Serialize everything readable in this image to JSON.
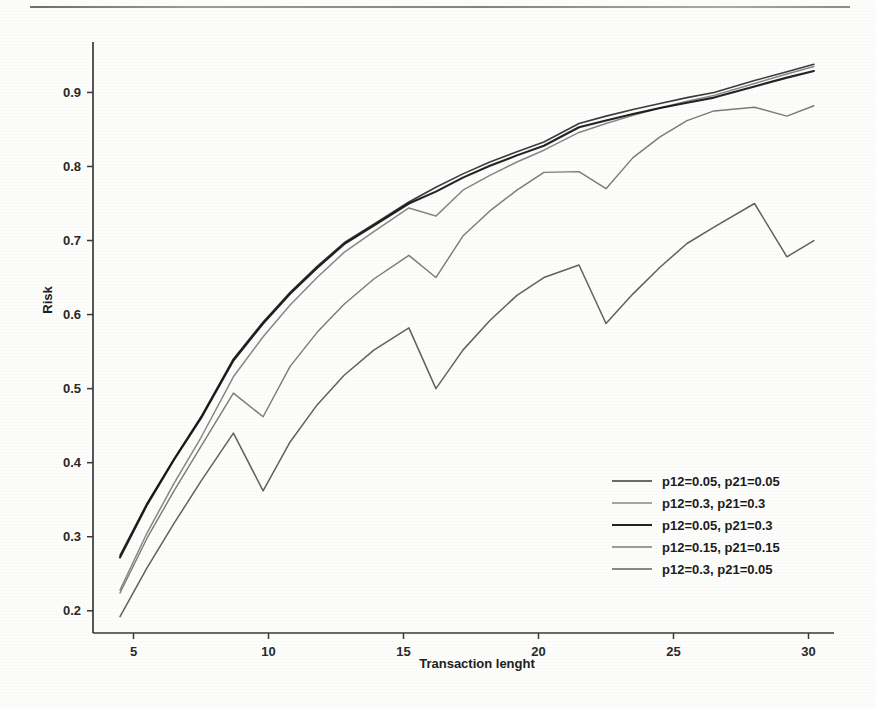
{
  "chart_data": {
    "type": "line",
    "title": "",
    "xlabel": "Transaction lenght",
    "ylabel": "Risk",
    "xlim": [
      3.5,
      30.5
    ],
    "ylim": [
      0.17,
      0.96
    ],
    "xticks": [
      5,
      10,
      15,
      20,
      25,
      30
    ],
    "yticks": [
      0.2,
      0.3,
      0.4,
      0.5,
      0.6,
      0.7,
      0.8,
      0.9
    ],
    "xticklabels": [
      "5",
      "10",
      "15",
      "20",
      "25",
      "30"
    ],
    "yticklabels": [
      "0.2",
      "0.3",
      "0.4",
      "0.5",
      "0.6",
      "0.7",
      "0.8",
      "0.9"
    ],
    "grid": false,
    "legend_position": "lower right",
    "x": [
      4.5,
      5.5,
      6.5,
      7.5,
      8.7,
      9.8,
      10.8,
      11.8,
      12.8,
      13.9,
      15.2,
      16.2,
      17.2,
      18.2,
      19.2,
      20.2,
      21.5,
      22.5,
      23.5,
      24.5,
      25.5,
      26.5,
      28.0,
      29.2,
      30.2
    ],
    "series": [
      {
        "name": "p12=0.05, p21=0.05",
        "color": "#2b2b2b",
        "width": 1.6,
        "values": [
          0.275,
          0.345,
          0.405,
          0.462,
          0.54,
          0.59,
          0.63,
          0.665,
          0.697,
          0.722,
          0.752,
          0.772,
          0.79,
          0.806,
          0.82,
          0.833,
          0.858,
          0.868,
          0.877,
          0.885,
          0.893,
          0.9,
          0.916,
          0.928,
          0.938
        ]
      },
      {
        "name": "p12=0.3, p21=0.3",
        "color": "#7d7d7d",
        "width": 1.5,
        "values": [
          0.228,
          0.305,
          0.372,
          0.434,
          0.516,
          0.57,
          0.613,
          0.65,
          0.684,
          0.712,
          0.744,
          0.733,
          0.768,
          0.788,
          0.806,
          0.822,
          0.846,
          0.858,
          0.869,
          0.879,
          0.888,
          0.896,
          0.912,
          0.925,
          0.935
        ]
      },
      {
        "name": "p12=0.05, p21=0.3",
        "color": "#111111",
        "width": 2.1,
        "values": [
          0.272,
          0.343,
          0.404,
          0.46,
          0.538,
          0.588,
          0.628,
          0.663,
          0.695,
          0.72,
          0.75,
          0.766,
          0.785,
          0.801,
          0.815,
          0.828,
          0.853,
          0.862,
          0.871,
          0.879,
          0.886,
          0.893,
          0.908,
          0.92,
          0.929
        ]
      },
      {
        "name": "p12=0.15, p21=0.15",
        "color": "#6f6f6f",
        "width": 1.4,
        "values": [
          0.224,
          0.298,
          0.362,
          0.422,
          0.494,
          0.462,
          0.53,
          0.576,
          0.614,
          0.648,
          0.68,
          0.65,
          0.706,
          0.74,
          0.768,
          0.792,
          0.793,
          0.77,
          0.812,
          0.84,
          0.862,
          0.875,
          0.88,
          0.868,
          0.882
        ]
      },
      {
        "name": "p12=0.3, p21=0.05",
        "color": "#545454",
        "width": 1.5,
        "values": [
          0.192,
          0.258,
          0.318,
          0.375,
          0.44,
          0.362,
          0.428,
          0.478,
          0.518,
          0.552,
          0.582,
          0.5,
          0.552,
          0.592,
          0.626,
          0.65,
          0.667,
          0.588,
          0.628,
          0.664,
          0.696,
          0.718,
          0.75,
          0.678,
          0.7
        ]
      }
    ]
  },
  "legend": {
    "items": [
      {
        "label": "p12=0.05, p21=0.05",
        "color": "#2b2b2b"
      },
      {
        "label": "p12=0.3, p21=0.3",
        "color": "#7d7d7d"
      },
      {
        "label": "p12=0.05, p21=0.3",
        "color": "#111111"
      },
      {
        "label": "p12=0.15, p21=0.15",
        "color": "#6f6f6f"
      },
      {
        "label": "p12=0.3, p21=0.05",
        "color": "#545454"
      }
    ]
  }
}
